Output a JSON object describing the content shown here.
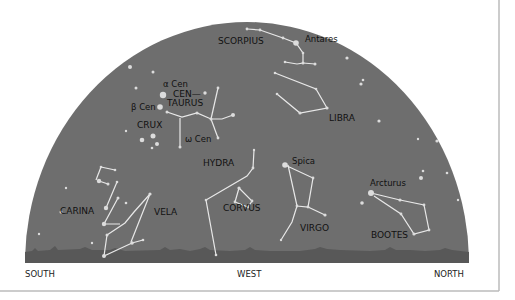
{
  "colors": {
    "sky": "#6e6e6e",
    "horizon": "#5a5a5a",
    "lines": "#e8e8e8",
    "stars": "#dcdcdc",
    "frame": "#999999"
  },
  "directions": {
    "south": "SOUTH",
    "west": "WEST",
    "north": "NORTH"
  },
  "constellations": [
    {
      "name": "SCORPIUS",
      "x": 218,
      "y": 44
    },
    {
      "name": "LIBRA",
      "x": 329,
      "y": 121
    },
    {
      "name": "CEN—",
      "x": 172,
      "y": 97
    },
    {
      "name": "TAURUS",
      "x": 167,
      "y": 106
    },
    {
      "name": "CRUX",
      "x": 137,
      "y": 128
    },
    {
      "name": "HYDRA",
      "x": 203,
      "y": 166
    },
    {
      "name": "CORVUS",
      "x": 223,
      "y": 211
    },
    {
      "name": "CARINA",
      "x": 60,
      "y": 214
    },
    {
      "name": "VELA",
      "x": 154,
      "y": 215
    },
    {
      "name": "VIRGO",
      "x": 300,
      "y": 231
    },
    {
      "name": "BOOTES",
      "x": 371,
      "y": 238
    }
  ],
  "stars": [
    {
      "name": "Antares",
      "x": 296,
      "y": 43
    },
    {
      "name": "α Cen",
      "x": 163,
      "y": 87
    },
    {
      "name": "β Cen",
      "x": 131,
      "y": 106
    },
    {
      "name": "ω Cen",
      "x": 185,
      "y": 140
    },
    {
      "name": "Spica",
      "x": 292,
      "y": 165
    },
    {
      "name": "Arcturus",
      "x": 370,
      "y": 186
    }
  ]
}
